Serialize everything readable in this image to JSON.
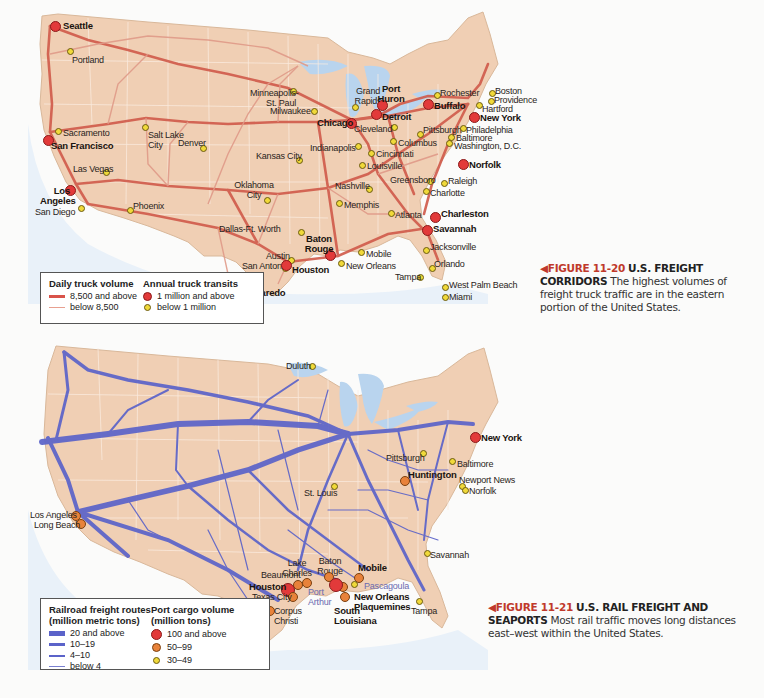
{
  "figure_11_20": {
    "number": "FIGURE 11-20",
    "title": "U.S. FREIGHT CORRIDORS",
    "caption": "The highest volumes of freight truck traffic are in the eastern portion of the United States.",
    "legend": {
      "volume_heading": "Daily truck volume",
      "volume_items": [
        {
          "label": "8,500 and above",
          "color": "#d9534a"
        },
        {
          "label": "below 8,500",
          "color": "#e8a090"
        }
      ],
      "transit_heading": "Annual truck transits",
      "transit_items": [
        {
          "label": "1 million and above",
          "color": "#e23a3a"
        },
        {
          "label": "below 1 million",
          "color": "#f0d93a"
        }
      ]
    },
    "cities": [
      {
        "name": "Seattle",
        "size": "big"
      },
      {
        "name": "Portland",
        "size": "small"
      },
      {
        "name": "Sacramento",
        "size": "small"
      },
      {
        "name": "San Francisco",
        "size": "big"
      },
      {
        "name": "Salt Lake City",
        "size": "small"
      },
      {
        "name": "Denver",
        "size": "small"
      },
      {
        "name": "Las Vegas",
        "size": "small"
      },
      {
        "name": "Los Angeles",
        "size": "big"
      },
      {
        "name": "San Diego",
        "size": "small"
      },
      {
        "name": "Phoenix",
        "size": "small"
      },
      {
        "name": "Minneapolis-St. Paul",
        "size": "small"
      },
      {
        "name": "Kansas City",
        "size": "small"
      },
      {
        "name": "Oklahoma City",
        "size": "small"
      },
      {
        "name": "Dallas-Ft. Worth",
        "size": "small"
      },
      {
        "name": "Austin",
        "size": "small"
      },
      {
        "name": "San Antonio",
        "size": "small"
      },
      {
        "name": "Laredo",
        "size": "big"
      },
      {
        "name": "Houston",
        "size": "big"
      },
      {
        "name": "Baton Rouge",
        "size": "big"
      },
      {
        "name": "New Orleans",
        "size": "small"
      },
      {
        "name": "Mobile",
        "size": "small"
      },
      {
        "name": "Memphis",
        "size": "small"
      },
      {
        "name": "Nashville",
        "size": "small"
      },
      {
        "name": "Milwaukee",
        "size": "small"
      },
      {
        "name": "Chicago",
        "size": "big"
      },
      {
        "name": "Grand Rapids",
        "size": "small"
      },
      {
        "name": "Port Huron",
        "size": "big"
      },
      {
        "name": "Detroit",
        "size": "big"
      },
      {
        "name": "Cleveland",
        "size": "small"
      },
      {
        "name": "Indianapolis",
        "size": "small"
      },
      {
        "name": "Columbus",
        "size": "small"
      },
      {
        "name": "Cincinnati",
        "size": "small"
      },
      {
        "name": "Louisville",
        "size": "small"
      },
      {
        "name": "Pittsburgh",
        "size": "small"
      },
      {
        "name": "Buffalo",
        "size": "big"
      },
      {
        "name": "Rochester",
        "size": "small"
      },
      {
        "name": "Boston",
        "size": "small"
      },
      {
        "name": "Providence",
        "size": "small"
      },
      {
        "name": "Hartford",
        "size": "small"
      },
      {
        "name": "New York",
        "size": "big"
      },
      {
        "name": "Philadelphia",
        "size": "small"
      },
      {
        "name": "Baltimore",
        "size": "small"
      },
      {
        "name": "Washington, D.C.",
        "size": "small"
      },
      {
        "name": "Norfolk",
        "size": "big"
      },
      {
        "name": "Greensboro",
        "size": "small"
      },
      {
        "name": "Raleigh",
        "size": "small"
      },
      {
        "name": "Charlotte",
        "size": "small"
      },
      {
        "name": "Atlanta",
        "size": "small"
      },
      {
        "name": "Charleston",
        "size": "big"
      },
      {
        "name": "Savannah",
        "size": "big"
      },
      {
        "name": "Jacksonville",
        "size": "small"
      },
      {
        "name": "Orlando",
        "size": "small"
      },
      {
        "name": "Tampa",
        "size": "small"
      },
      {
        "name": "West Palm Beach",
        "size": "small"
      },
      {
        "name": "Miami",
        "size": "small"
      }
    ]
  },
  "figure_11_21": {
    "number": "FIGURE 11-21",
    "title": "U.S. RAIL FREIGHT AND SEAPORTS",
    "caption": "Most rail traffic moves long distances east–west within the United States.",
    "legend": {
      "rail_heading_1": "Railroad freight routes",
      "rail_heading_2": "(million metric tons)",
      "rail_items": [
        {
          "label": "20 and above",
          "width": 6
        },
        {
          "label": "10–19",
          "width": 4
        },
        {
          "label": "4–10",
          "width": 2.5
        },
        {
          "label": "below 4",
          "width": 1
        }
      ],
      "rail_color": "#5b63c9",
      "port_heading_1": "Port cargo volume",
      "port_heading_2": "(million tons)",
      "port_items": [
        {
          "label": "100 and above",
          "color": "#e23a3a"
        },
        {
          "label": "50–99",
          "color": "#e8823a"
        },
        {
          "label": "30–49",
          "color": "#f0d93a"
        }
      ]
    },
    "ports": [
      {
        "name": "Duluth",
        "size": "small"
      },
      {
        "name": "New York",
        "size": "big"
      },
      {
        "name": "Pittsburgh",
        "size": "small"
      },
      {
        "name": "Baltimore",
        "size": "small"
      },
      {
        "name": "Huntington",
        "size": "mid"
      },
      {
        "name": "Newport News",
        "size": "small"
      },
      {
        "name": "Norfolk",
        "size": "small"
      },
      {
        "name": "St. Louis",
        "size": "small"
      },
      {
        "name": "Los Angeles",
        "size": "mid"
      },
      {
        "name": "Long Beach",
        "size": "mid"
      },
      {
        "name": "Savannah",
        "size": "small"
      },
      {
        "name": "Lake Charles",
        "size": "mid"
      },
      {
        "name": "Baton Rouge",
        "size": "mid"
      },
      {
        "name": "Mobile",
        "size": "mid"
      },
      {
        "name": "Beaumont",
        "size": "mid"
      },
      {
        "name": "Houston",
        "size": "big"
      },
      {
        "name": "Texas City",
        "size": "mid"
      },
      {
        "name": "Port Arthur",
        "size": "mid"
      },
      {
        "name": "Pascagoula",
        "size": "small"
      },
      {
        "name": "New Orleans",
        "size": "mid"
      },
      {
        "name": "Plaquemines",
        "size": "mid"
      },
      {
        "name": "South Louisiana",
        "size": "big"
      },
      {
        "name": "Corpus Christi",
        "size": "mid"
      },
      {
        "name": "Tampa",
        "size": "small"
      }
    ]
  },
  "colors": {
    "land": "#f0cfb4",
    "water": "#b9d4ee",
    "state_border": "#fbeee2",
    "truck_route_heavy": "#d05a4a",
    "truck_route_light": "#e09a88",
    "rail_route": "#5b63c9",
    "figure_label": "#c0392b"
  }
}
